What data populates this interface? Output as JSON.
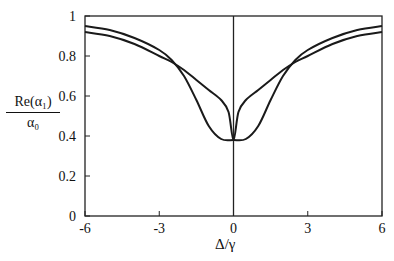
{
  "chart_data": {
    "type": "line",
    "title": "",
    "xlabel": "Δ/γ",
    "ylabel": {
      "numerator": "Re(α₁)",
      "denominator": "α₀"
    },
    "xlim": [
      -6,
      6
    ],
    "ylim": [
      0,
      1
    ],
    "xticks": [
      -6,
      -3,
      0,
      3,
      6
    ],
    "xtick_labels": [
      "-6",
      "-3",
      "0",
      "3",
      "6"
    ],
    "yticks": [
      0,
      0.2,
      0.4,
      0.6,
      0.8,
      1
    ],
    "ytick_labels": [
      "0",
      "0.2",
      "0.4",
      "0.6",
      "0.8",
      "1"
    ],
    "grid": false,
    "legend": null,
    "vertical_line_at_x": 0,
    "series": [
      {
        "name": "curve-1 (broad flat minimum)",
        "x": [
          -6,
          -5,
          -4,
          -3,
          -2.5,
          -2,
          -1.5,
          -1,
          -0.5,
          0,
          0.5,
          1,
          1.5,
          2,
          2.5,
          3,
          4,
          5,
          6
        ],
        "y": [
          0.95,
          0.93,
          0.89,
          0.83,
          0.78,
          0.7,
          0.58,
          0.45,
          0.385,
          0.38,
          0.385,
          0.45,
          0.58,
          0.7,
          0.78,
          0.83,
          0.89,
          0.93,
          0.95
        ]
      },
      {
        "name": "curve-2 (sharp central dip)",
        "x": [
          -6,
          -5,
          -4,
          -3,
          -2.5,
          -2,
          -1.5,
          -1,
          -0.5,
          -0.2,
          0,
          0.2,
          0.5,
          1,
          1.5,
          2,
          2.5,
          3,
          4,
          5,
          6
        ],
        "y": [
          0.92,
          0.9,
          0.86,
          0.8,
          0.77,
          0.73,
          0.68,
          0.63,
          0.58,
          0.52,
          0.38,
          0.52,
          0.58,
          0.63,
          0.68,
          0.73,
          0.77,
          0.8,
          0.86,
          0.9,
          0.92
        ]
      }
    ]
  }
}
